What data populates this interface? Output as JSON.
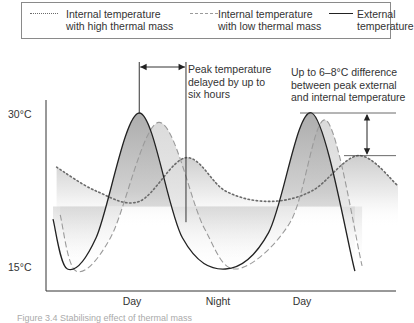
{
  "chart_data": {
    "type": "line",
    "title": "",
    "xlabel": "",
    "ylabel": "",
    "x_tick_labels": [
      "Day",
      "Night",
      "Day"
    ],
    "y_tick_labels": [
      "30°C",
      "15°C"
    ],
    "ylim": [
      14,
      33
    ],
    "xlim": [
      0,
      48
    ],
    "x_unit": "hours",
    "legend": {
      "placement": "top",
      "entries": [
        {
          "key": "high",
          "label_line1": "Internal temperature",
          "label_line2": "with high thermal mass",
          "style": "dotted"
        },
        {
          "key": "low",
          "label_line1": "Internal temperature",
          "label_line2": "with low thermal mass",
          "style": "dashed"
        },
        {
          "key": "external",
          "label_line1": "External",
          "label_line2": "temperature",
          "style": "solid"
        }
      ]
    },
    "series": [
      {
        "name": "External temperature",
        "key": "external",
        "x": [
          0,
          2,
          6,
          12,
          18,
          24,
          30,
          36,
          42
        ],
        "y": [
          19.8,
          15.0,
          18.0,
          30.0,
          18.0,
          15.0,
          18.5,
          30.0,
          14.8
        ]
      },
      {
        "name": "Internal temperature with low thermal mass",
        "key": "low",
        "x": [
          1,
          3.2,
          8,
          14.7,
          21,
          25.5,
          33,
          38,
          43
        ],
        "y": [
          20.2,
          14.8,
          18.0,
          29.1,
          19.0,
          15.0,
          19.5,
          29.3,
          15.3
        ]
      },
      {
        "name": "Internal temperature with high thermal mass",
        "key": "high",
        "x": [
          0.5,
          6,
          12,
          18.5,
          24,
          30,
          36,
          42.5,
          48
        ],
        "y": [
          24.8,
          22.5,
          21.5,
          25.7,
          22.5,
          21.5,
          22.5,
          25.9,
          23.0
        ]
      }
    ],
    "annotations": [
      {
        "text_lines": [
          "Peak temperature",
          "delayed by up to",
          "six hours"
        ],
        "type": "horizontal-double-arrow",
        "from_x": 12,
        "to x": 18.5
      },
      {
        "text_lines": [
          "Up to 6–8°C difference",
          "between peak external",
          "and internal temperature"
        ],
        "type": "vertical-double-arrow",
        "from_y": 30.0,
        "to_y": 25.9
      }
    ],
    "grid": false
  },
  "caption": "Figure 3.4  Stabilising effect of thermal mass"
}
